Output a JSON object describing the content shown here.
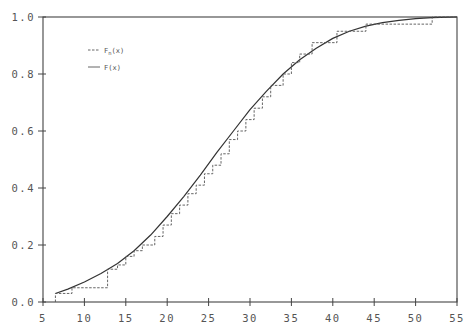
{
  "chart_data": {
    "type": "line",
    "title": "",
    "xlabel": "",
    "ylabel": "",
    "xlim": [
      5,
      55
    ],
    "ylim": [
      0.0,
      1.0
    ],
    "grid": false,
    "legend_position": "upper-left",
    "x_ticks": [
      "5",
      "10",
      "15",
      "20",
      "25",
      "30",
      "35",
      "40",
      "45",
      "50",
      "55"
    ],
    "y_ticks": [
      "0.0",
      "0.2",
      "0.4",
      "0.6",
      "0.8",
      "1.0"
    ],
    "legend": [
      {
        "label": "F_n(x)",
        "style": "dashed"
      },
      {
        "label": "F(x)",
        "style": "solid"
      }
    ],
    "series": [
      {
        "name": "F(x)",
        "style": "solid",
        "x": [
          6.5,
          8,
          10,
          12,
          14,
          16,
          18,
          20,
          22,
          24,
          26,
          28,
          30,
          32,
          34,
          36,
          38,
          40,
          42,
          44,
          46,
          48,
          50,
          52,
          55
        ],
        "y": [
          0.03,
          0.045,
          0.07,
          0.1,
          0.135,
          0.18,
          0.235,
          0.3,
          0.37,
          0.445,
          0.525,
          0.6,
          0.675,
          0.74,
          0.8,
          0.85,
          0.89,
          0.925,
          0.95,
          0.968,
          0.98,
          0.988,
          0.994,
          0.998,
          1.0
        ]
      },
      {
        "name": "F_n(x)",
        "style": "dashed-step",
        "x": [
          6.5,
          8.5,
          12.8,
          14,
          15,
          16,
          17,
          18.5,
          19.5,
          20.5,
          21.5,
          22.5,
          23.5,
          24.5,
          25.5,
          26.5,
          27.5,
          28.5,
          29.5,
          30.5,
          31.5,
          32.5,
          34,
          35,
          36,
          37.5,
          40.5,
          44,
          52
        ],
        "y": [
          0.03,
          0.05,
          0.115,
          0.13,
          0.16,
          0.18,
          0.2,
          0.23,
          0.27,
          0.31,
          0.34,
          0.38,
          0.41,
          0.45,
          0.48,
          0.52,
          0.57,
          0.6,
          0.64,
          0.68,
          0.72,
          0.76,
          0.8,
          0.84,
          0.87,
          0.91,
          0.95,
          0.975,
          1.0
        ]
      }
    ]
  }
}
